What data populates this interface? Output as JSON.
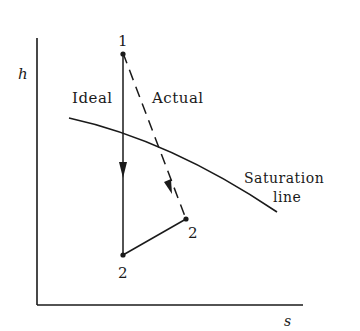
{
  "diagram": {
    "type": "h-s diagram (Mollier) turbine expansion",
    "axes": {
      "y_label": "h",
      "x_label": "s"
    },
    "points": {
      "start": "1",
      "ideal_end": "2",
      "actual_end": "2"
    },
    "process_labels": {
      "ideal": "Ideal",
      "actual": "Actual"
    },
    "curve_label": {
      "line1": "Saturation",
      "line2": "line"
    },
    "colors": {
      "ink": "#1a1a1a",
      "background": "#ffffff"
    }
  }
}
